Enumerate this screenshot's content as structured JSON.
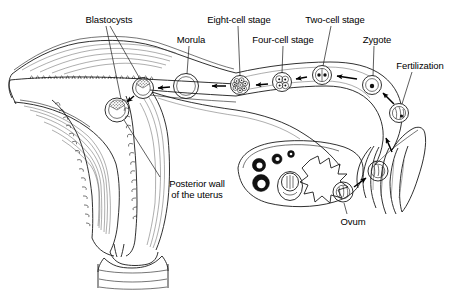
{
  "figure": {
    "background_color": "#ffffff",
    "ink_color": "#1a1a1a",
    "width": 459,
    "height": 291
  },
  "labels": [
    {
      "id": "blastocysts",
      "text": "Blastocysts",
      "x": 74,
      "y": 14,
      "width": 70,
      "align": "center"
    },
    {
      "id": "morula",
      "text": "Morula",
      "x": 167,
      "y": 34,
      "width": 48,
      "align": "center"
    },
    {
      "id": "eight_cell",
      "text": "Eight-cell stage",
      "x": 196,
      "y": 14,
      "width": 86,
      "align": "center"
    },
    {
      "id": "four_cell",
      "text": "Four-cell stage",
      "x": 243,
      "y": 34,
      "width": 80,
      "align": "center"
    },
    {
      "id": "two_cell",
      "text": "Two-cell stage",
      "x": 296,
      "y": 14,
      "width": 78,
      "align": "center"
    },
    {
      "id": "zygote",
      "text": "Zygote",
      "x": 355,
      "y": 34,
      "width": 44,
      "align": "center"
    },
    {
      "id": "fertilization",
      "text": "Fertilization",
      "x": 385,
      "y": 60,
      "width": 70,
      "align": "center"
    },
    {
      "id": "posterior_wall",
      "text": "Posterior wall\nof the uterus",
      "x": 155,
      "y": 178,
      "width": 84,
      "align": "center"
    },
    {
      "id": "ovum",
      "text": "Ovum",
      "x": 333,
      "y": 216,
      "width": 40,
      "align": "center"
    }
  ],
  "structures": [
    {
      "id": "uterus",
      "name": "Uterus (body and cavity)"
    },
    {
      "id": "endometrium",
      "name": "Endometrium lining"
    },
    {
      "id": "myometrium",
      "name": "Myometrium muscular wall"
    },
    {
      "id": "cervix",
      "name": "Cervix"
    },
    {
      "id": "vagina",
      "name": "Vaginal canal"
    },
    {
      "id": "fallopian_tube",
      "name": "Fallopian tube (oviduct)"
    },
    {
      "id": "fimbriae",
      "name": "Fimbriae"
    },
    {
      "id": "ovary",
      "name": "Ovary"
    },
    {
      "id": "corpus_luteum",
      "name": "Corpus luteum"
    },
    {
      "id": "graafian_follicle",
      "name": "Mature Graafian follicle"
    },
    {
      "id": "primary_follicles",
      "name": "Developing follicles"
    }
  ],
  "developmental_stages": [
    {
      "id": "fertilization_cell",
      "name": "Fertilization",
      "cx": 399,
      "cy": 113,
      "r": 9.5,
      "type": "fertilized"
    },
    {
      "id": "zygote_cell",
      "name": "Zygote",
      "cx": 372,
      "cy": 85,
      "r": 9.5,
      "type": "single-nucleus"
    },
    {
      "id": "two_cell_cell",
      "name": "Two-cell stage",
      "cx": 322,
      "cy": 75,
      "r": 9.5,
      "type": "two-cell"
    },
    {
      "id": "four_cell_cell",
      "name": "Four-cell stage",
      "cx": 282,
      "cy": 82,
      "r": 9.5,
      "type": "four-cell"
    },
    {
      "id": "eight_cell_cell",
      "name": "Eight-cell stage",
      "cx": 240,
      "cy": 85,
      "r": 9.5,
      "type": "eight-cell"
    },
    {
      "id": "morula_cell",
      "name": "Morula",
      "cx": 186,
      "cy": 86,
      "r": 12.5,
      "type": "morula"
    },
    {
      "id": "blastocyst_tube",
      "name": "Blastocyst in cavity",
      "cx": 143,
      "cy": 88,
      "r": 10.5,
      "type": "blastocyst"
    },
    {
      "id": "blastocyst_implant",
      "name": "Implanting blastocyst",
      "cx": 117,
      "cy": 110,
      "r": 12.0,
      "type": "blastocyst"
    },
    {
      "id": "ovum_released",
      "name": "Ovum",
      "cx": 343,
      "cy": 192,
      "r": 10.0,
      "type": "ovum"
    },
    {
      "id": "ovum_captured",
      "name": "Ovum in fimbriae",
      "cx": 378,
      "cy": 171,
      "r": 10.0,
      "type": "ovum"
    }
  ],
  "flow_arrows": [
    {
      "id": "arrow-fert-to-zygote",
      "from": "fertilization_cell",
      "to": "zygote_cell",
      "direction": "up-left"
    },
    {
      "id": "arrow-zygote-to-two",
      "from": "zygote_cell",
      "to": "two_cell_cell",
      "direction": "left"
    },
    {
      "id": "arrow-two-to-four",
      "from": "two_cell_cell",
      "to": "four_cell_cell",
      "direction": "left"
    },
    {
      "id": "arrow-four-to-eight",
      "from": "four_cell_cell",
      "to": "eight_cell_cell",
      "direction": "left"
    },
    {
      "id": "arrow-eight-to-morula",
      "from": "eight_cell_cell",
      "to": "morula_cell",
      "direction": "left"
    },
    {
      "id": "arrow-morula-to-blast",
      "from": "morula_cell",
      "to": "blastocyst_tube",
      "direction": "left"
    },
    {
      "id": "arrow-blast-to-implant",
      "from": "blastocyst_tube",
      "to": "blastocyst_implant",
      "direction": "down-left"
    },
    {
      "id": "arrow-ovum-to-fimbria",
      "from": "ovum_released",
      "to": "ovum_captured",
      "direction": "up-right"
    },
    {
      "id": "arrow-fimbria-up",
      "from": "fimbriae",
      "to": "fallopian_tube",
      "direction": "up"
    }
  ]
}
